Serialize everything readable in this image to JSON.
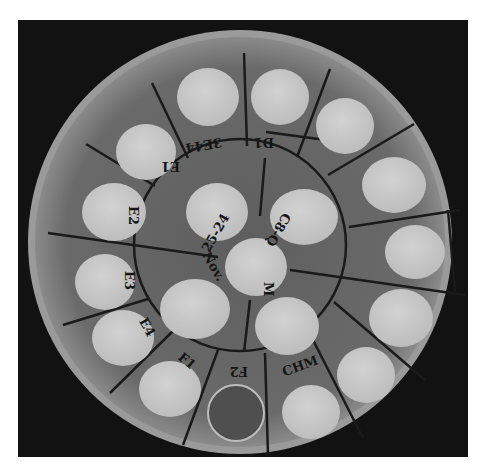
{
  "image": {
    "subject": "Petri dish with bacterial colony spots in labeled radial sectors",
    "background_color": "#121212",
    "agar_color": "#6e6e6e",
    "colony_color": "#c9c9c9",
    "line_color": "#1a1a1a"
  },
  "center_labels": {
    "date": "25-24",
    "month": "Nov.",
    "code1": "M",
    "code2": "C8-Q"
  },
  "outer_labels": [
    {
      "id": "e1",
      "text": "E1"
    },
    {
      "id": "top-left",
      "text": "3E44"
    },
    {
      "id": "top",
      "text": "D1"
    },
    {
      "id": "e2",
      "text": "E2"
    },
    {
      "id": "e3",
      "text": "E3"
    },
    {
      "id": "e4",
      "text": "E4"
    },
    {
      "id": "f1",
      "text": "F1"
    },
    {
      "id": "f2",
      "text": "F2"
    },
    {
      "id": "bottom-right",
      "text": "CHM"
    }
  ],
  "empty_well_note": "One sector (F2) shows an empty ring with no growth"
}
